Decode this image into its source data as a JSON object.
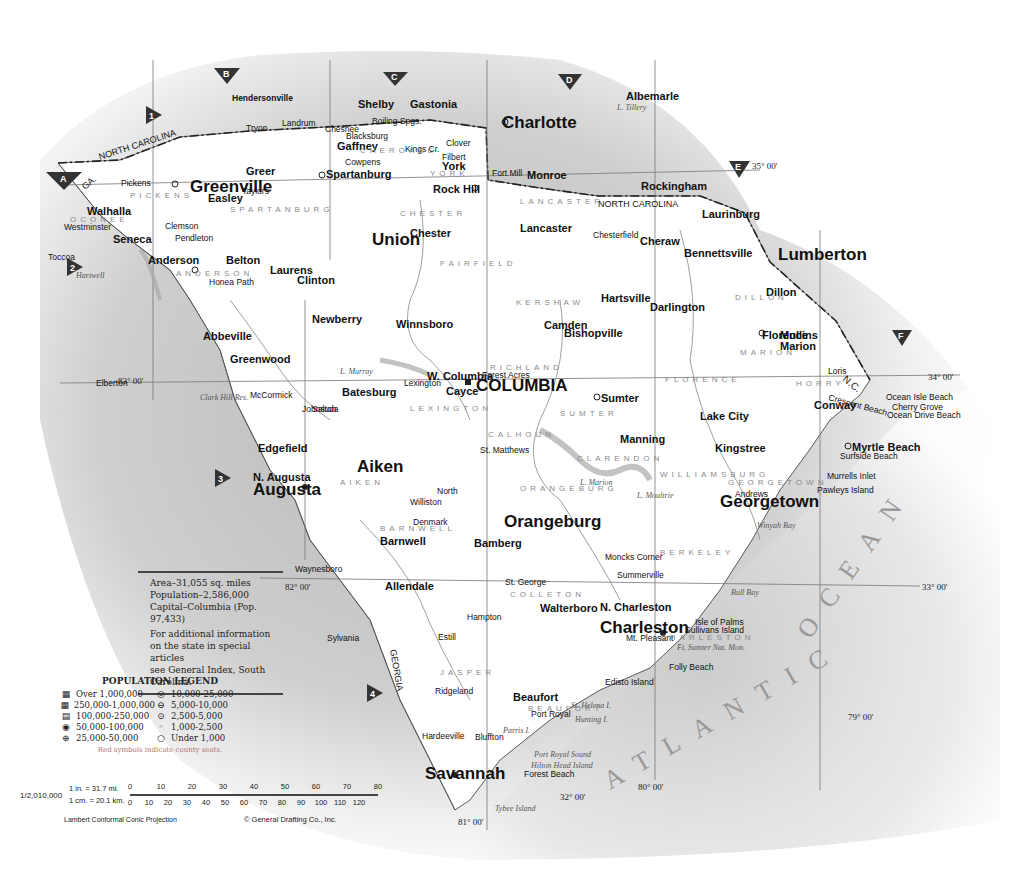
{
  "map": {
    "state": "South Carolina",
    "ocean_label": "ATLANTIC OCEAN",
    "ocean_words": [
      "ATLANTIC",
      "OCEAN"
    ],
    "state_labels": {
      "north_carolina_1": "NORTH CAROLINA",
      "north_carolina_2": "NORTH CAROLINA",
      "nc_short": "N.C.",
      "georgia": "GEORGIA",
      "ga": "GA."
    },
    "grid_markers": {
      "columns": [
        "A",
        "B",
        "C",
        "D",
        "E",
        "F"
      ],
      "rows": [
        "1",
        "2",
        "3",
        "4"
      ]
    },
    "coordinates": {
      "lat_35": "35° 00'",
      "lat_34": "34° 00'",
      "lat_33": "33° 00'",
      "lat_32": "32° 00'",
      "lon_83": "83° 00'",
      "lon_82": "82° 00'",
      "lon_81": "81° 00'",
      "lon_80": "80° 00'",
      "lon_79": "79° 00'"
    },
    "major_cities": [
      {
        "name": "Charlotte"
      },
      {
        "name": "Greenville"
      },
      {
        "name": "Spartanburg"
      },
      {
        "name": "Rock Hill"
      },
      {
        "name": "COLUMBIA"
      },
      {
        "name": "Augusta"
      },
      {
        "name": "Charleston"
      },
      {
        "name": "Savannah"
      },
      {
        "name": "Florence"
      },
      {
        "name": "Sumter"
      },
      {
        "name": "Anderson"
      },
      {
        "name": "Myrtle Beach"
      }
    ],
    "cities": [
      "Hendersonville",
      "Shelby",
      "Gastonia",
      "Albemarle",
      "Rockingham",
      "Laurinburg",
      "Lumberton",
      "Monroe",
      "Tryon",
      "Landrum",
      "Chesnee",
      "Boiling Spgs.",
      "Clover",
      "Blacksburg",
      "Gaffney",
      "Cowpens",
      "Kings Cr.",
      "Filbert",
      "York",
      "Fort Mill",
      "Pickens",
      "Easley",
      "Greer",
      "Taylors",
      "Seneca",
      "Walhalla",
      "Westminster",
      "Clemson",
      "Pendleton",
      "Belton",
      "Honea Path",
      "Abbeville",
      "Laurens",
      "Clinton",
      "Union",
      "Chester",
      "Lancaster",
      "Chesterfield",
      "Cheraw",
      "Bennettsville",
      "Marion",
      "Mullins",
      "Dillon",
      "Darlington",
      "Hartsville",
      "Greenwood",
      "Newberry",
      "Winnsboro",
      "Camden",
      "Bishopville",
      "Lake City",
      "Kingstree",
      "Conway",
      "Georgetown",
      "Andrews",
      "Manning",
      "Saluda",
      "Edgefield",
      "Johnston",
      "Batesburg",
      "Lexington",
      "W. Columbia",
      "Cayce",
      "Forest Acres",
      "Aiken",
      "N. Augusta",
      "North",
      "Orangeburg",
      "St. Matthews",
      "Bamberg",
      "Barnwell",
      "Allendale",
      "Denmark",
      "Williston",
      "Walterboro",
      "St. George",
      "Summerville",
      "Moncks Corner",
      "N. Charleston",
      "Mt. Pleasant",
      "Beaufort",
      "Port Royal",
      "Ridgeland",
      "Hampton",
      "Estill",
      "Bluffton",
      "Hardeeville",
      "Waynesboro",
      "Sylvania",
      "Toccoa",
      "Elberton",
      "McCormick",
      "Folly Beach",
      "Isle of Palms",
      "Sullivans Island",
      "Edisto Island",
      "Forest Beach",
      "Surfside Beach",
      "Murrells Inlet",
      "Pawleys Island",
      "Loris",
      "Cherry Grove",
      "Ocean Drive Beach",
      "Crescent Beach",
      "Ocean Isle Beach"
    ],
    "counties": [
      "PICKENS",
      "OCONEE",
      "ANDERSON",
      "SPARTANBURG",
      "CHEROKEE",
      "YORK",
      "LANCASTER",
      "CHESTER",
      "FAIRFIELD",
      "KERSHAW",
      "RICHLAND",
      "LEXINGTON",
      "SUMTER",
      "CLARENDON",
      "WILLIAMSBURG",
      "GEORGETOWN",
      "HORRY",
      "MARION",
      "DILLON",
      "FLORENCE",
      "CALHOUN",
      "ORANGEBURG",
      "AIKEN",
      "BARNWELL",
      "COLLETON",
      "JASPER",
      "BEAUFORT",
      "BERKELEY",
      "CHARLESTON",
      "SALUDA",
      "LAURENS",
      "NEWBERRY",
      "ABBEVILLE",
      "GREENWOOD",
      "MARLBORO",
      "CHESTERFIELD",
      "DARLINGTON",
      "EDGEFIELD",
      "McCORMICK",
      "HAMPTON",
      "ALLENDALE",
      "BAMBERG",
      "DORCHESTER",
      "LEE",
      "UNION"
    ],
    "water_features": [
      "Hartwell",
      "Clark Hill Res.",
      "L. Murray",
      "L. Marion",
      "L. Moultrie",
      "Port Royal Sound",
      "St. Helena I.",
      "Hunting I.",
      "Parris I.",
      "Hilton Head Island",
      "Tybee Island",
      "Winyah Bay",
      "Bull Bay",
      "L. Tillery",
      "Ft. Sumter Nat. Mon."
    ]
  },
  "info_box": {
    "area": "Area–31,055 sq. miles",
    "population": "Population–2,586,000",
    "capital": "Capital–Columbia (Pop. 97,433)",
    "note_line1": "For additional information",
    "note_line2": "on the state in special articles",
    "note_line3": "see General Index, South Carolina."
  },
  "legend": {
    "title": "POPULATION LEGEND",
    "items": [
      {
        "symbol": "▦",
        "label": "Over 1,000,000"
      },
      {
        "symbol": "◎",
        "label": "10,000-25,000"
      },
      {
        "symbol": "▦",
        "label": "250,000-1,000,000"
      },
      {
        "symbol": "⊖",
        "label": "5,000-10,000"
      },
      {
        "symbol": "▤",
        "label": "100,000-250,000"
      },
      {
        "symbol": "⊙",
        "label": "2,500-5,000"
      },
      {
        "symbol": "◉",
        "label": "50,000-100,000"
      },
      {
        "symbol": "◦",
        "label": "1,000-2,500"
      },
      {
        "symbol": "⊕",
        "label": "25,000-50,000"
      },
      {
        "symbol": "○",
        "label": "Under 1,000"
      }
    ],
    "note": "Red symbols indicate county seats."
  },
  "scale": {
    "ratio": "1/2,010,000",
    "miles_label": "1 in. = 31.7 mi.",
    "km_label": "1 cm. = 20.1 km.",
    "mile_ticks": [
      "0",
      "10",
      "20",
      "30",
      "40",
      "50",
      "60",
      "70",
      "80"
    ],
    "km_ticks": [
      "0",
      "10",
      "20",
      "30",
      "40",
      "50",
      "60",
      "70",
      "80",
      "90",
      "100",
      "110",
      "120"
    ],
    "projection": "Lambert Conformal Conic Projection",
    "copyright": "© General Drafting Co., Inc."
  }
}
